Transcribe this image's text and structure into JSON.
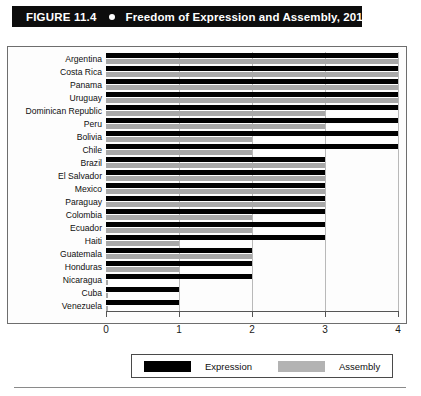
{
  "figure": {
    "number": "FIGURE 11.4",
    "bullet_icon": "bullet-dot",
    "title": "Freedom of Expression and Assembly, 2019"
  },
  "legend": {
    "expression_label": "Expression",
    "assembly_label": "Assembly",
    "expression_color": "#000000",
    "assembly_color": "#b3b3b3"
  },
  "axis": {
    "x_ticks": [
      "0",
      "1",
      "2",
      "3",
      "4"
    ]
  },
  "chart_data": {
    "type": "bar",
    "orientation": "horizontal",
    "title": "Freedom of Expression and Assembly, 2019",
    "xlabel": "",
    "ylabel": "",
    "xlim": [
      0,
      4
    ],
    "x_ticks": [
      0,
      1,
      2,
      3,
      4
    ],
    "grid": true,
    "legend_position": "bottom",
    "categories": [
      "Argentina",
      "Costa Rica",
      "Panama",
      "Uruguay",
      "Dominican Republic",
      "Peru",
      "Bolivia",
      "Chile",
      "Brazil",
      "El Salvador",
      "Mexico",
      "Paraguay",
      "Colombia",
      "Ecuador",
      "Haiti",
      "Guatemala",
      "Honduras",
      "Nicaragua",
      "Cuba",
      "Venezuela"
    ],
    "series": [
      {
        "name": "Expression",
        "color": "#000000",
        "values": [
          4,
          4,
          4,
          4,
          4,
          4,
          4,
          4,
          3,
          3,
          3,
          3,
          3,
          3,
          3,
          2,
          2,
          2,
          1,
          1
        ]
      },
      {
        "name": "Assembly",
        "color": "#a8a8a8",
        "values": [
          4,
          4,
          4,
          4,
          3,
          3,
          2,
          2,
          3,
          3,
          3,
          3,
          2,
          2,
          1,
          2,
          1,
          0,
          0,
          0
        ]
      }
    ]
  }
}
